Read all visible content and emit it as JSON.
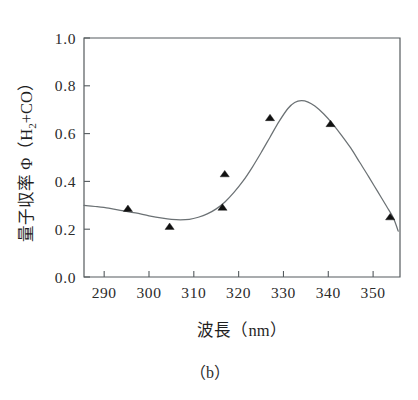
{
  "caption": "（b）",
  "chart_data": {
    "type": "scatter",
    "title": "",
    "subtitle": "",
    "xlabel": "波長（nm）",
    "ylabel_parts": {
      "main": "量子収率 Φ（H",
      "sub": "2",
      "tail": "+CO）"
    },
    "ylabel": "量子収率 Φ（H2+CO）",
    "xlim": [
      285.5,
      356.0
    ],
    "ylim": [
      0.0,
      1.0
    ],
    "xticks": [
      290,
      300,
      310,
      320,
      330,
      340,
      350
    ],
    "xtick_labels": [
      "290",
      "300",
      "310",
      "320",
      "330",
      "340",
      "350"
    ],
    "yticks": [
      0.0,
      0.2,
      0.4,
      0.6,
      0.8,
      1.0
    ],
    "ytick_labels": [
      "0.0",
      "0.2",
      "0.4",
      "0.6",
      "0.8",
      "1.0"
    ],
    "grid": false,
    "legend": false,
    "legend_position": "none",
    "marker_style": "filled-triangle",
    "marker_color": "#111111",
    "line_color": "#6b7174",
    "axis_color": "#555b5e",
    "series": [
      {
        "name": "measured",
        "type": "scatter",
        "points": [
          {
            "x": 295.3,
            "y": 0.285
          },
          {
            "x": 304.6,
            "y": 0.21
          },
          {
            "x": 316.4,
            "y": 0.29
          },
          {
            "x": 316.9,
            "y": 0.43
          },
          {
            "x": 327.0,
            "y": 0.665
          },
          {
            "x": 340.5,
            "y": 0.64
          },
          {
            "x": 353.8,
            "y": 0.25
          }
        ]
      },
      {
        "name": "fitted-curve",
        "type": "line",
        "points": [
          {
            "x": 285.5,
            "y": 0.3
          },
          {
            "x": 288.0,
            "y": 0.295
          },
          {
            "x": 291.0,
            "y": 0.288
          },
          {
            "x": 294.0,
            "y": 0.278
          },
          {
            "x": 297.0,
            "y": 0.268
          },
          {
            "x": 300.0,
            "y": 0.256
          },
          {
            "x": 303.0,
            "y": 0.246
          },
          {
            "x": 305.0,
            "y": 0.241
          },
          {
            "x": 307.0,
            "y": 0.239
          },
          {
            "x": 309.0,
            "y": 0.241
          },
          {
            "x": 311.0,
            "y": 0.25
          },
          {
            "x": 313.0,
            "y": 0.264
          },
          {
            "x": 315.0,
            "y": 0.285
          },
          {
            "x": 317.0,
            "y": 0.315
          },
          {
            "x": 319.0,
            "y": 0.355
          },
          {
            "x": 321.0,
            "y": 0.402
          },
          {
            "x": 323.0,
            "y": 0.458
          },
          {
            "x": 325.0,
            "y": 0.52
          },
          {
            "x": 327.0,
            "y": 0.585
          },
          {
            "x": 329.0,
            "y": 0.65
          },
          {
            "x": 331.0,
            "y": 0.705
          },
          {
            "x": 332.5,
            "y": 0.73
          },
          {
            "x": 334.0,
            "y": 0.738
          },
          {
            "x": 335.5,
            "y": 0.732
          },
          {
            "x": 337.0,
            "y": 0.715
          },
          {
            "x": 339.0,
            "y": 0.682
          },
          {
            "x": 341.0,
            "y": 0.64
          },
          {
            "x": 343.0,
            "y": 0.592
          },
          {
            "x": 345.0,
            "y": 0.54
          },
          {
            "x": 347.0,
            "y": 0.48
          },
          {
            "x": 349.0,
            "y": 0.42
          },
          {
            "x": 351.0,
            "y": 0.358
          },
          {
            "x": 353.0,
            "y": 0.296
          },
          {
            "x": 354.5,
            "y": 0.248
          },
          {
            "x": 355.6,
            "y": 0.192
          }
        ]
      }
    ]
  }
}
